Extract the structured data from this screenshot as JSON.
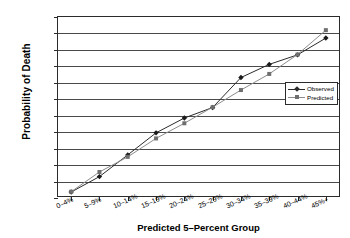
{
  "chart_data": {
    "type": "line",
    "title": "",
    "xlabel": "Predicted 5–Percent Group",
    "ylabel": "Probability of Death",
    "categories": [
      "0–4%",
      "5–9%",
      "10–14%",
      "15–19%",
      "20–24%",
      "25–29%",
      "30–34%",
      "35–39%",
      "40–44%",
      "45%+"
    ],
    "ylim": [
      0.0,
      0.55
    ],
    "ytick_labels": [
      "0.00",
      "0.05",
      "0.10",
      "0.15",
      "0.20",
      "0.25",
      "0.30",
      "0.35",
      "0.40",
      "0.45",
      "0.50",
      "0.55"
    ],
    "ytick_values": [
      0.0,
      0.05,
      0.1,
      0.15,
      0.2,
      0.25,
      0.3,
      0.35,
      0.4,
      0.45,
      0.5,
      0.55
    ],
    "grid": true,
    "legend_position": "right",
    "series": [
      {
        "name": "Observed",
        "marker": "diamond",
        "color": "#2b2b2b",
        "values": [
          0.015,
          0.062,
          0.128,
          0.195,
          0.24,
          0.272,
          0.363,
          0.403,
          0.432,
          0.483
        ]
      },
      {
        "name": "Predicted",
        "marker": "square",
        "color": "#8c8c8c",
        "values": [
          0.016,
          0.076,
          0.122,
          0.178,
          0.224,
          0.273,
          0.325,
          0.374,
          0.433,
          0.507
        ]
      }
    ]
  },
  "legend": {
    "observed_label": "Observed",
    "predicted_label": "Predicted"
  }
}
